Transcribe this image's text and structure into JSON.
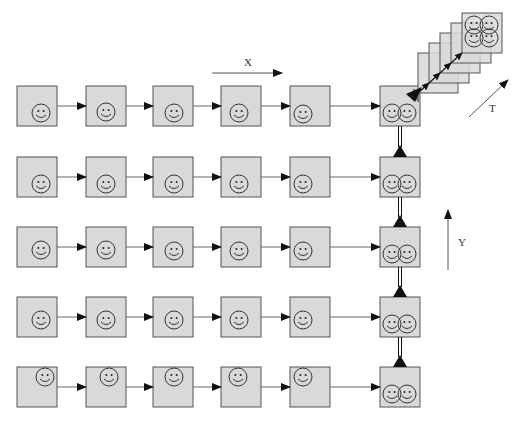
{
  "labels": {
    "x": "X",
    "y": "Y",
    "t": "T"
  },
  "colors": {
    "box_fill": "#d9d9d9",
    "box_stroke": "#555555",
    "arrow": "#111111",
    "line": "#666666",
    "face": "#222222"
  },
  "grid": {
    "rows": 5,
    "columns": 5,
    "row_y": [
      86,
      157,
      227,
      297,
      367
    ],
    "col_x": [
      17,
      86,
      153,
      221,
      290
    ],
    "box_size": 40,
    "smiley_offset": [
      [
        [
          24,
          27
        ],
        [
          20,
          26
        ],
        [
          21,
          27
        ],
        [
          18,
          27
        ],
        [
          13,
          28
        ]
      ],
      [
        [
          24,
          27
        ],
        [
          20,
          27
        ],
        [
          21,
          27
        ],
        [
          18,
          27
        ],
        [
          13,
          27
        ]
      ],
      [
        [
          24,
          23
        ],
        [
          20,
          23
        ],
        [
          21,
          24
        ],
        [
          18,
          24
        ],
        [
          13,
          24
        ]
      ],
      [
        [
          24,
          23
        ],
        [
          20,
          23
        ],
        [
          21,
          23
        ],
        [
          18,
          23
        ],
        [
          13,
          23
        ]
      ],
      [
        [
          28,
          10
        ],
        [
          23,
          10
        ],
        [
          21,
          10
        ],
        [
          17,
          10
        ],
        [
          13,
          10
        ]
      ]
    ]
  },
  "merge_column": {
    "x": 380,
    "box_size": 40,
    "row_y": [
      86,
      157,
      227,
      297,
      367
    ]
  },
  "time_stack": {
    "frames": 5,
    "start": [
      418,
      53
    ],
    "step": [
      11,
      -10
    ],
    "size": 40
  },
  "axis_arrows": {
    "x": {
      "from": [
        212,
        73
      ],
      "to": [
        282,
        73
      ]
    },
    "y": {
      "from": [
        448,
        270
      ],
      "to": [
        448,
        210
      ]
    },
    "t": {
      "from": [
        469,
        117
      ],
      "to": [
        508,
        80
      ]
    }
  }
}
